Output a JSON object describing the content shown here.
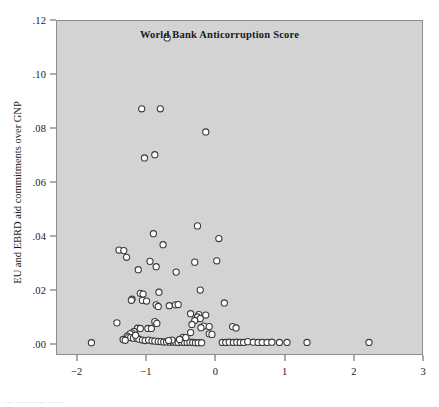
{
  "figure": {
    "background_color": "#ffffff",
    "plot_background_color": "#d3d3d3",
    "frame_color": "#8d8d8d",
    "marker_color": "#ffffff",
    "marker_edge_color": "#3a3a3a",
    "bottom_caption": "—  ———— ——"
  },
  "chart_data": {
    "type": "scatter",
    "title": "",
    "xlabel": "World Bank Anticorruption Score",
    "ylabel": "EU and EBRD aid commitments over GNP",
    "xlim": [
      -2.3,
      3.0
    ],
    "ylim": [
      -0.004,
      0.12
    ],
    "grid": false,
    "legend": null,
    "xticks": [
      -2,
      -1,
      0,
      1,
      2,
      3
    ],
    "xticklabels": [
      "−2",
      "−1",
      "0",
      "1",
      "2",
      "3"
    ],
    "yticks": [
      0.0,
      0.02,
      0.04,
      0.06,
      0.08,
      0.1,
      0.12
    ],
    "yticklabels": [
      ".00",
      ".02",
      ".04",
      ".06",
      ".08",
      ".10",
      ".12"
    ],
    "marker": "open-circle",
    "marker_size": 5,
    "points": [
      [
        -0.7,
        0.1137
      ],
      [
        -1.07,
        0.0873
      ],
      [
        -0.8,
        0.0873
      ],
      [
        -0.14,
        0.0787
      ],
      [
        -1.03,
        0.069
      ],
      [
        -0.88,
        0.0702
      ],
      [
        -0.26,
        0.0437
      ],
      [
        -0.9,
        0.0408
      ],
      [
        0.05,
        0.039
      ],
      [
        -0.76,
        0.0367
      ],
      [
        -1.4,
        0.0347
      ],
      [
        -1.33,
        0.0345
      ],
      [
        -1.29,
        0.032
      ],
      [
        -0.95,
        0.0305
      ],
      [
        -0.3,
        0.0302
      ],
      [
        0.02,
        0.0307
      ],
      [
        -0.86,
        0.0285
      ],
      [
        -1.12,
        0.0274
      ],
      [
        -0.57,
        0.0265
      ],
      [
        -0.22,
        0.0198
      ],
      [
        -0.82,
        0.019
      ],
      [
        -1.09,
        0.0186
      ],
      [
        -1.05,
        0.0183
      ],
      [
        -1.21,
        0.0164
      ],
      [
        -1.22,
        0.016
      ],
      [
        -1.06,
        0.016
      ],
      [
        -1.0,
        0.0157
      ],
      [
        0.13,
        0.015
      ],
      [
        -0.86,
        0.0143
      ],
      [
        -0.83,
        0.0137
      ],
      [
        -0.67,
        0.014
      ],
      [
        -0.58,
        0.0143
      ],
      [
        -0.54,
        0.0144
      ],
      [
        -0.36,
        0.011
      ],
      [
        -0.24,
        0.0107
      ],
      [
        -0.14,
        0.0105
      ],
      [
        -0.26,
        0.0098
      ],
      [
        -0.22,
        0.0092
      ],
      [
        -0.3,
        0.0085
      ],
      [
        -0.88,
        0.0081
      ],
      [
        -0.85,
        0.0074
      ],
      [
        -1.43,
        0.0076
      ],
      [
        -0.34,
        0.007
      ],
      [
        -0.17,
        0.0064
      ],
      [
        -0.09,
        0.0062
      ],
      [
        -0.21,
        0.0058
      ],
      [
        0.25,
        0.0062
      ],
      [
        0.3,
        0.0057
      ],
      [
        -1.13,
        0.0056
      ],
      [
        -1.09,
        0.0055
      ],
      [
        -0.98,
        0.0055
      ],
      [
        -0.93,
        0.0055
      ],
      [
        -1.18,
        0.0044
      ],
      [
        -1.21,
        0.0038
      ],
      [
        -1.24,
        0.0035
      ],
      [
        -0.36,
        0.004
      ],
      [
        -0.09,
        0.0035
      ],
      [
        -0.05,
        0.0033
      ],
      [
        -1.28,
        0.0027
      ],
      [
        -1.26,
        0.0023
      ],
      [
        -1.23,
        0.0021
      ],
      [
        -1.19,
        0.0019
      ],
      [
        -1.14,
        0.0019
      ],
      [
        -1.11,
        0.0015
      ],
      [
        -1.06,
        0.0012
      ],
      [
        -1.02,
        0.001
      ],
      [
        -0.97,
        0.0012
      ],
      [
        -0.92,
        0.0009
      ],
      [
        -0.88,
        0.0008
      ],
      [
        -0.83,
        0.0007
      ],
      [
        -0.79,
        0.0006
      ],
      [
        -0.75,
        0.0005
      ],
      [
        -0.71,
        0.0005
      ],
      [
        -0.66,
        0.0004
      ],
      [
        -0.62,
        0.0005
      ],
      [
        -0.58,
        0.0004
      ],
      [
        -0.54,
        0.0003
      ],
      [
        -0.49,
        0.0004
      ],
      [
        -0.45,
        0.0003
      ],
      [
        -0.41,
        0.0003
      ],
      [
        -0.37,
        0.0004
      ],
      [
        -0.33,
        0.0003
      ],
      [
        -0.29,
        0.0002
      ],
      [
        -0.25,
        0.0002
      ],
      [
        -0.2,
        0.0002
      ],
      [
        -1.8,
        0.0002
      ],
      [
        -1.34,
        0.0014
      ],
      [
        -1.31,
        0.0011
      ],
      [
        0.1,
        0.0003
      ],
      [
        0.15,
        0.0003
      ],
      [
        0.2,
        0.0004
      ],
      [
        0.26,
        0.0003
      ],
      [
        0.31,
        0.0004
      ],
      [
        0.36,
        0.0003
      ],
      [
        0.41,
        0.0003
      ],
      [
        0.47,
        0.0006
      ],
      [
        0.55,
        0.0004
      ],
      [
        0.62,
        0.0003
      ],
      [
        0.68,
        0.0003
      ],
      [
        0.75,
        0.0003
      ],
      [
        0.82,
        0.0004
      ],
      [
        0.93,
        0.0003
      ],
      [
        1.04,
        0.0003
      ],
      [
        1.33,
        0.0003
      ],
      [
        2.23,
        0.0003
      ],
      [
        -1.16,
        0.003
      ],
      [
        -0.47,
        0.0022
      ],
      [
        -0.43,
        0.0021
      ],
      [
        -0.52,
        0.0014
      ],
      [
        -0.63,
        0.0012
      ],
      [
        -0.68,
        0.001
      ]
    ]
  }
}
